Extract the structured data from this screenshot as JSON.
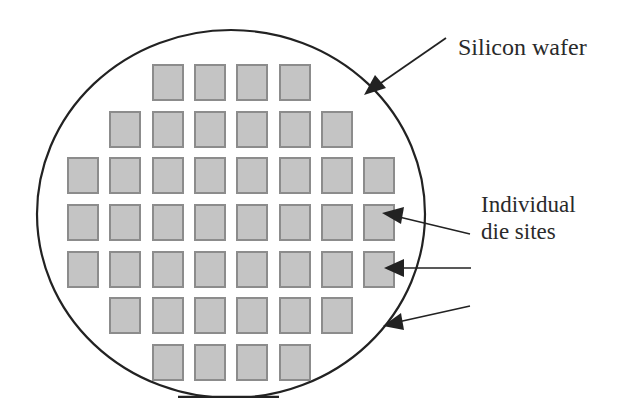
{
  "diagram": {
    "labels": {
      "wafer": "Silicon wafer",
      "die_line1": "Individual",
      "die_line2": "die sites"
    },
    "wafer": {
      "shape": "circle-with-flat",
      "stroke_color": "#222222",
      "fill_color": "#ffffff"
    },
    "die_grid": {
      "die_fill": "#c4c4c4",
      "die_border": "#8c8c8c",
      "rows": [
        {
          "columns": [
            2,
            3,
            4,
            5
          ]
        },
        {
          "columns": [
            1,
            2,
            3,
            4,
            5,
            6
          ]
        },
        {
          "columns": [
            0,
            1,
            2,
            3,
            4,
            5,
            6,
            7
          ]
        },
        {
          "columns": [
            0,
            1,
            2,
            3,
            4,
            5,
            6,
            7
          ]
        },
        {
          "columns": [
            0,
            1,
            2,
            3,
            4,
            5,
            6,
            7
          ]
        },
        {
          "columns": [
            1,
            2,
            3,
            4,
            5,
            6
          ]
        },
        {
          "columns": [
            2,
            3,
            4,
            5
          ]
        }
      ],
      "total_dies": 44
    },
    "arrows": [
      {
        "name": "wafer-arrow",
        "target": "Silicon wafer edge"
      },
      {
        "name": "die-arrow-1",
        "target": "die row 3, column 8"
      },
      {
        "name": "die-arrow-2",
        "target": "die row 4, column 8"
      },
      {
        "name": "die-arrow-3",
        "target": "die row 5, column 8"
      }
    ]
  }
}
